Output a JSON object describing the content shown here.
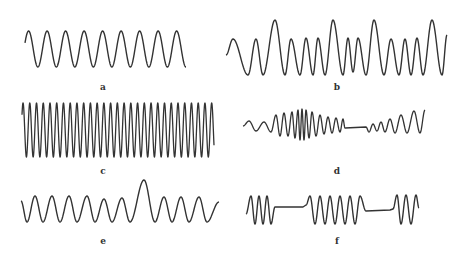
{
  "figure": {
    "background": "#ffffff",
    "stroke_color": "#333333",
    "panels": [
      {
        "id": "a",
        "label": "a",
        "description": "Uniform sinusoid, constant frequency and amplitude",
        "label_pos": [
          103,
          83
        ],
        "segments": [
          {
            "type": "sine",
            "x0": 25,
            "x1": 186,
            "y_center": 49,
            "amp": 18,
            "cycles": 8.7,
            "phase": -0.5
          }
        ]
      },
      {
        "id": "b",
        "label": "b",
        "description": "Sinusoid with varying amplitude and frequency (beats)",
        "label_pos": [
          337,
          83
        ],
        "segments": [
          {
            "type": "custom_b",
            "x0": 226,
            "x1": 447,
            "y_center": 48,
            "amp_min": 17,
            "amp_max": 28
          }
        ]
      },
      {
        "id": "c",
        "label": "c",
        "description": "High-frequency sinusoid, constant amplitude",
        "label_pos": [
          103,
          167
        ],
        "segments": [
          {
            "type": "sine",
            "x0": 22,
            "x1": 214,
            "y_center": 130,
            "amp": 27,
            "cycles": 28.5,
            "phase": -0.5
          }
        ]
      },
      {
        "id": "d",
        "label": "d",
        "description": "Chirp-like burst with gap (flat line) then short burst",
        "label_pos": [
          337,
          167
        ],
        "segments": [
          {
            "type": "custom_d",
            "x0": 243,
            "x1": 425,
            "y_center": 124
          }
        ]
      },
      {
        "id": "e",
        "label": "e",
        "description": "Sinusoid with a single transient spike",
        "label_pos": [
          103,
          237
        ],
        "segments": [
          {
            "type": "custom_e",
            "x0": 21,
            "x1": 219,
            "y_center": 204,
            "amp": 14,
            "spike_amp": 26
          }
        ]
      },
      {
        "id": "f",
        "label": "f",
        "description": "Sinusoid bursts separated by flat gaps",
        "label_pos": [
          337,
          237
        ],
        "segments": [
          {
            "type": "custom_f",
            "x0": 246,
            "x1": 419,
            "y_center": 209,
            "amp": 15
          }
        ]
      }
    ]
  }
}
